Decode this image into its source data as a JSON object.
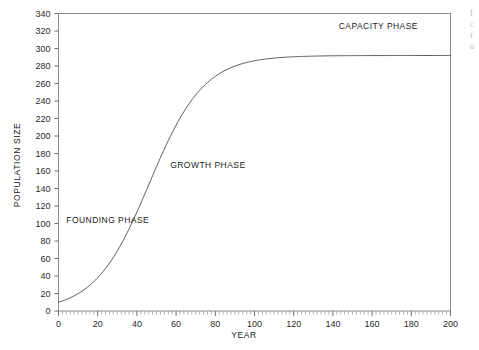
{
  "chart_data": {
    "type": "line",
    "title": "",
    "xlabel": "YEAR",
    "ylabel": "POPULATION SIZE",
    "xlim": [
      0,
      200
    ],
    "ylim": [
      0,
      340
    ],
    "grid": false,
    "legend_position": "none",
    "x_ticks": [
      0,
      20,
      40,
      60,
      80,
      100,
      120,
      140,
      160,
      180,
      200
    ],
    "x_tick_labels": [
      "0",
      "20",
      "40",
      "60",
      "80",
      "100",
      "120",
      "140",
      "160",
      "180",
      "200"
    ],
    "x_minor_tick_interval": 2,
    "y_ticks": [
      0,
      20,
      40,
      60,
      80,
      100,
      120,
      140,
      160,
      180,
      200,
      220,
      240,
      260,
      280,
      300,
      320,
      340
    ],
    "y_tick_labels": [
      "0",
      "20",
      "40",
      "60",
      "80",
      "100",
      "120",
      "140",
      "160",
      "180",
      "200",
      "220",
      "240",
      "260",
      "280",
      "300",
      "320",
      "340"
    ],
    "series": [
      {
        "name": "Population growth",
        "curve": "logistic",
        "carrying_capacity": 292,
        "initial_population": 10,
        "growth_rate": 0.072,
        "inflection_year": 62,
        "x": [
          0,
          5,
          10,
          15,
          20,
          25,
          30,
          35,
          40,
          45,
          50,
          55,
          60,
          65,
          70,
          75,
          80,
          85,
          90,
          95,
          100,
          110,
          120,
          130,
          140,
          150,
          160,
          170,
          180,
          190,
          200
        ],
        "values": [
          10,
          13,
          18,
          24,
          32,
          42,
          55,
          70,
          89,
          110,
          133,
          157,
          181,
          204,
          224,
          241,
          255,
          266,
          274,
          280,
          284,
          289,
          291,
          292,
          292,
          292,
          292,
          292,
          292,
          292,
          292
        ]
      }
    ],
    "annotations": [
      {
        "id": "founding",
        "text": "FOUNDING PHASE",
        "x_year": 4,
        "y_value": 101
      },
      {
        "id": "growth",
        "text": "GROWTH PHASE",
        "x_year": 57,
        "y_value": 163
      },
      {
        "id": "capacity",
        "text": "CAPACITY PHASE",
        "x_year": 143,
        "y_value": 322
      }
    ]
  },
  "edge_text": {
    "line1": "I",
    "line2": "c",
    "line3": "f",
    "line4": "u"
  }
}
